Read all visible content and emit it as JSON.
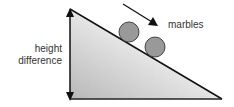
{
  "diagram": {
    "labels": {
      "height_line1": "height",
      "height_line2": "difference",
      "marbles": "marbles"
    },
    "colors": {
      "stroke": "#111111",
      "marble_fill": "#999999",
      "ramp_gradient_dark": "#bcbcbc",
      "ramp_gradient_light": "#f7f7f7"
    }
  }
}
